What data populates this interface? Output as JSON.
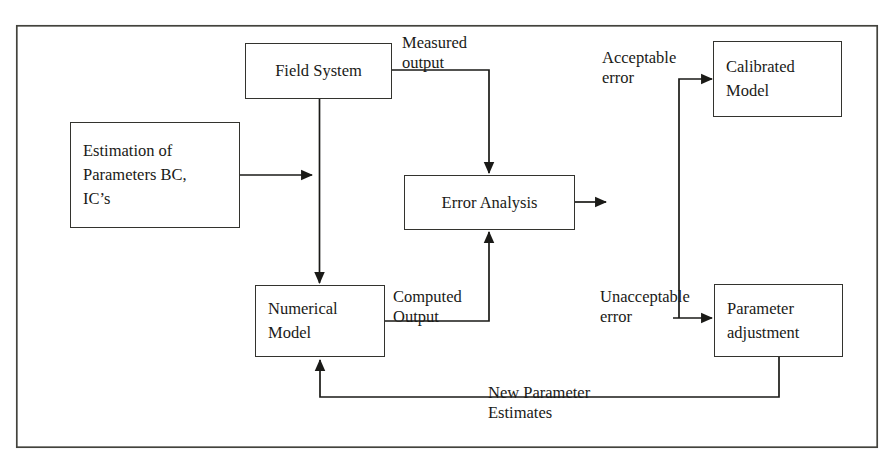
{
  "figure": {
    "kind": "flowchart",
    "frame_color": "#33332e",
    "line_color": "#1a1a17",
    "background": "#ffffff"
  },
  "nodes": [
    {
      "id": "field-system",
      "lines": [
        "Field System"
      ],
      "x": 245,
      "y": 43,
      "w": 147,
      "h": 56,
      "align": "center"
    },
    {
      "id": "estimation-of-parameters",
      "lines": [
        "Estimation of",
        "Parameters BC,",
        "IC’s"
      ],
      "x": 70,
      "y": 122,
      "w": 170,
      "h": 106,
      "align": "left"
    },
    {
      "id": "error-analysis",
      "lines": [
        "Error Analysis"
      ],
      "x": 404,
      "y": 175,
      "w": 171,
      "h": 55,
      "align": "center"
    },
    {
      "id": "calibrated-model",
      "lines": [
        "Calibrated",
        "Model"
      ],
      "x": 713,
      "y": 41,
      "w": 129,
      "h": 76,
      "align": "left"
    },
    {
      "id": "numerical-model",
      "lines": [
        "Numerical",
        "Model"
      ],
      "x": 255,
      "y": 285,
      "w": 130,
      "h": 72,
      "align": "left"
    },
    {
      "id": "parameter-adjustment",
      "lines": [
        "Parameter",
        "adjustment"
      ],
      "x": 714,
      "y": 284,
      "w": 129,
      "h": 73,
      "align": "left"
    }
  ],
  "edge_labels": [
    {
      "id": "measured-output",
      "lines": [
        "Measured",
        "output"
      ],
      "x": 402,
      "y": 33
    },
    {
      "id": "acceptable-error",
      "lines": [
        "Acceptable",
        "error"
      ],
      "x": 602,
      "y": 48
    },
    {
      "id": "computed-output",
      "lines": [
        "Computed",
        "Output"
      ],
      "x": 393,
      "y": 287
    },
    {
      "id": "unacceptable-error",
      "lines": [
        "Unacceptable",
        "error"
      ],
      "x": 600,
      "y": 287
    },
    {
      "id": "new-parameter-estimates",
      "lines": [
        "New Parameter",
        "Estimates"
      ],
      "x": 488,
      "y": 383
    }
  ],
  "frame": {
    "x": 16,
    "y": 25,
    "w": 862,
    "h": 423
  },
  "connections": [
    {
      "id": "estimation-to-numerical-join",
      "from": "estimation-of-parameters",
      "to": "numerical-model",
      "arrow": true
    },
    {
      "id": "field-system-to-numerical-model",
      "from": "field-system",
      "to": "numerical-model",
      "arrow": true
    },
    {
      "id": "field-system-to-error-analysis",
      "from": "field-system",
      "to": "error-analysis",
      "arrow": true,
      "label": "measured-output"
    },
    {
      "id": "numerical-model-to-error-analysis",
      "from": "numerical-model",
      "to": "error-analysis",
      "arrow": true,
      "label": "computed-output"
    },
    {
      "id": "error-analysis-out",
      "from": "error-analysis",
      "to": "",
      "arrow": true
    },
    {
      "id": "error-to-calibrated-model",
      "from": "error-analysis",
      "to": "calibrated-model",
      "arrow": true,
      "label": "acceptable-error"
    },
    {
      "id": "error-to-parameter-adjustment",
      "from": "error-analysis",
      "to": "parameter-adjustment",
      "arrow": true,
      "label": "unacceptable-error"
    },
    {
      "id": "parameter-adjustment-to-numerical-model",
      "from": "parameter-adjustment",
      "to": "numerical-model",
      "arrow": true,
      "label": "new-parameter-estimates"
    }
  ]
}
